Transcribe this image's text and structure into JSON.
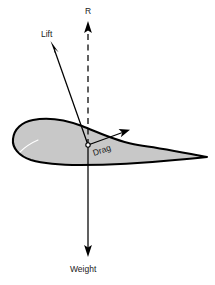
{
  "diagram": {
    "background_color": "#ffffff",
    "airfoil": {
      "name": "airfoil-cross-section",
      "fill_color": "#c8c8c8",
      "outline_color": "#000000",
      "highlight_color": "#ffffff",
      "leading_edge": "rounded-left",
      "trailing_edge": "sharp-point-right"
    },
    "origin": {
      "name": "center-of-pressure",
      "x": 88,
      "y": 145
    },
    "vectors": [
      {
        "id": "resultant",
        "label": "R",
        "style": "dashed",
        "direction": "up",
        "color": "#000000",
        "label_x": 90,
        "label_y": 13,
        "label_rotation": 0
      },
      {
        "id": "lift",
        "label": "Lift",
        "style": "solid",
        "direction": "up-left",
        "color": "#000000",
        "label_x": 41,
        "label_y": 37,
        "label_rotation": 0
      },
      {
        "id": "drag",
        "label": "Drag",
        "style": "solid",
        "direction": "up-right",
        "color": "#000000",
        "label_x": 94,
        "label_y": 156,
        "label_rotation": -19
      },
      {
        "id": "weight",
        "label": "Weight",
        "style": "solid",
        "direction": "down",
        "color": "#000000",
        "label_x": 70,
        "label_y": 272,
        "label_rotation": 0
      }
    ]
  }
}
